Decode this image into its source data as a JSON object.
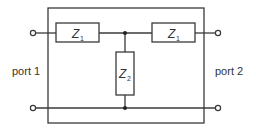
{
  "diagram": {
    "type": "two-port T-network",
    "components": {
      "series_left": {
        "symbol": "Z",
        "subscript": "1"
      },
      "series_right": {
        "symbol": "Z",
        "subscript": "1"
      },
      "shunt": {
        "symbol": "Z",
        "subscript": "2"
      }
    },
    "ports": {
      "left": "port 1",
      "right": "port 2"
    },
    "colors": {
      "line": "#3a3a3a",
      "background": "#ffffff"
    }
  }
}
